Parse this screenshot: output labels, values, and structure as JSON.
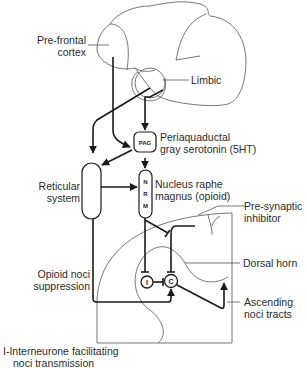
{
  "diagram": {
    "title": "",
    "labels": {
      "prefrontal": [
        "Pre-frontal",
        "cortex"
      ],
      "limbic": "Limbic",
      "pag_desc": [
        "Periaquaductal",
        "gray serotonin (5HT)"
      ],
      "reticular": [
        "Reticular",
        "system"
      ],
      "nrm_desc": [
        "Nucleus raphe",
        "magnus (opioid)"
      ],
      "presynaptic": [
        "Pre-synaptic",
        "inhibitor"
      ],
      "dorsal_horn": "Dorsal horn",
      "opioid": [
        "Opioid noci",
        "suppression"
      ],
      "ascending": [
        "Ascending",
        "noci tracts"
      ],
      "interneurone": [
        "I-Interneurone facilitating",
        "noci transmission"
      ]
    },
    "nodes": {
      "pag": "PAG",
      "nrm": [
        "N",
        "R",
        "M"
      ],
      "i_node": "I",
      "c_node": "C"
    },
    "colors": {
      "line": "#1a1a1a",
      "outline": "#555555",
      "text": "#2a2a2a"
    }
  }
}
